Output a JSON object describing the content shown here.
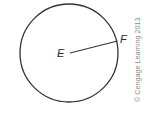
{
  "diagram": {
    "type": "circle-with-radius",
    "circle": {
      "center_label": "E",
      "cx": 69,
      "cy": 53,
      "r": 49,
      "stroke": "#333333"
    },
    "radius_segment": {
      "from_label": "E",
      "to_label": "F",
      "from": [
        70,
        53
      ],
      "to": [
        117.5,
        41
      ]
    },
    "labels": {
      "center": "E",
      "point_on_circle": "F"
    },
    "copyright": "© Cengage Learning 2013"
  }
}
